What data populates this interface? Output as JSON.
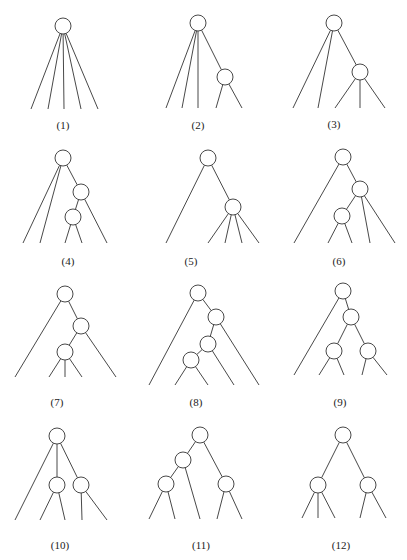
{
  "figure": {
    "trees": [
      {
        "label": "(1)",
        "structure": [
          "L",
          "L",
          "L",
          "L",
          "L"
        ]
      },
      {
        "label": "(2)",
        "structure": [
          "L",
          "L",
          "L",
          [
            "L",
            "L"
          ]
        ]
      },
      {
        "label": "(3)",
        "structure": [
          "L",
          "L",
          [
            "L",
            "L",
            "L"
          ]
        ]
      },
      {
        "label": "(4)",
        "structure": [
          "L",
          "L",
          [
            [
              "L",
              "L"
            ],
            "L"
          ]
        ]
      },
      {
        "label": "(5)",
        "structure": [
          "L",
          [
            "L",
            "L",
            "L",
            "L"
          ]
        ]
      },
      {
        "label": "(6)",
        "structure": [
          "L",
          [
            [
              "L",
              "L"
            ],
            "L",
            "L"
          ]
        ]
      },
      {
        "label": "(7)",
        "structure": [
          "L",
          [
            [
              "L",
              "L",
              "L"
            ],
            "L"
          ]
        ]
      },
      {
        "label": "(8)",
        "structure": [
          "L",
          [
            [
              [
                "L",
                "L"
              ],
              "L"
            ],
            "L"
          ]
        ]
      },
      {
        "label": "(9)",
        "structure": [
          "L",
          [
            [
              "L",
              "L"
            ],
            [
              "L",
              "L"
            ]
          ]
        ]
      },
      {
        "label": "(10)",
        "structure": [
          "L",
          [
            "L",
            "L"
          ],
          [
            "L",
            "L"
          ]
        ]
      },
      {
        "label": "(11)",
        "structure": [
          [
            [
              "L",
              "L"
            ],
            "L"
          ],
          [
            "L",
            "L"
          ]
        ]
      },
      {
        "label": "(12)",
        "structure": [
          [
            "L",
            "L",
            "L"
          ],
          [
            "L",
            "L"
          ]
        ]
      }
    ]
  }
}
